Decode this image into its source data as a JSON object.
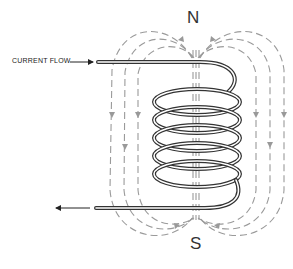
{
  "diagram": {
    "labels": {
      "north_pole": "N",
      "south_pole": "S",
      "current_flow": "CURRENT FLOW"
    },
    "coil": {
      "turns": 5,
      "wire_color": "#333333"
    },
    "field_lines": {
      "color": "#999999",
      "style": "dashed",
      "left_count": 3,
      "right_count": 3,
      "core_count": 3
    }
  }
}
